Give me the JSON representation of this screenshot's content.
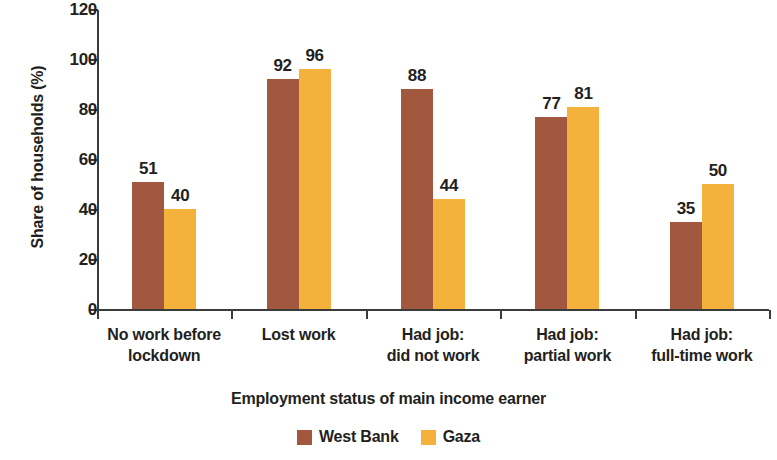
{
  "chart_data": {
    "type": "bar",
    "title": "",
    "subtitle": "",
    "xlabel": "Employment status of main income earner",
    "ylabel": "Share of households (%)",
    "ylim": [
      0,
      120
    ],
    "ytick_step": 20,
    "yticks": [
      "0",
      "20",
      "40",
      "60",
      "80",
      "100",
      "120"
    ],
    "grid": false,
    "legend_position": "bottom-center",
    "categories": [
      "No work before\nlockdown",
      "Lost work",
      "Had job:\ndid not work",
      "Had job:\npartial work",
      "Had job:\nfull-time work"
    ],
    "category_lines": [
      [
        "No work before",
        "lockdown"
      ],
      [
        "Lost work",
        ""
      ],
      [
        "Had job:",
        "did not work"
      ],
      [
        "Had job:",
        "partial work"
      ],
      [
        "Had job:",
        "full-time work"
      ]
    ],
    "series": [
      {
        "name": "West Bank",
        "color": "#a2573f",
        "values": [
          51,
          92,
          88,
          77,
          35
        ]
      },
      {
        "name": "Gaza",
        "color": "#f4b13c",
        "values": [
          40,
          96,
          44,
          81,
          50
        ]
      }
    ]
  },
  "legend": {
    "items": [
      {
        "label": "West Bank",
        "color": "#a2573f"
      },
      {
        "label": "Gaza",
        "color": "#f4b13c"
      }
    ]
  }
}
